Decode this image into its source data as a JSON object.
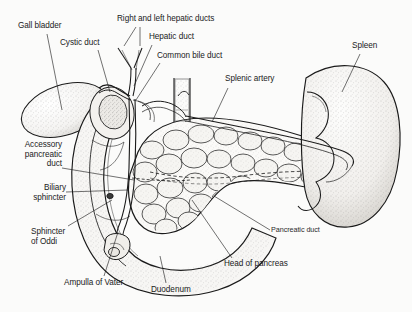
{
  "figure": {
    "style": "black-and-white stippled line drawing",
    "background_color": "#fbfbfa",
    "ink_color": "#1a1a1a"
  },
  "labels": [
    {
      "id": "gall-bladder",
      "text": "Gall bladder",
      "x": 18,
      "y": 21,
      "align": "left"
    },
    {
      "id": "cystic-duct",
      "text": "Cystic duct",
      "x": 60,
      "y": 38,
      "align": "left"
    },
    {
      "id": "hepatic-ducts",
      "text": "Right and left hepatic ducts",
      "x": 117,
      "y": 16,
      "align": "left"
    },
    {
      "id": "hepatic-duct",
      "text": "Hepatic duct",
      "x": 149,
      "y": 33,
      "align": "left"
    },
    {
      "id": "common-bile-duct",
      "text": "Common bile duct",
      "x": 157,
      "y": 52,
      "align": "left"
    },
    {
      "id": "splenic-artery",
      "text": "Splenic artery",
      "x": 225,
      "y": 75,
      "align": "left"
    },
    {
      "id": "spleen",
      "text": "Spleen",
      "x": 352,
      "y": 42,
      "align": "left"
    },
    {
      "id": "accessory-pancreatic-duct",
      "text": "Accessory\npancreatic\nduct",
      "x": 6,
      "y": 140,
      "align": "left"
    },
    {
      "id": "biliary-sphincter",
      "text": "Biliary\nsphincter",
      "x": 24,
      "y": 184,
      "align": "left"
    },
    {
      "id": "sphincter-of-oddi",
      "text": "Sphincter\nof Oddi",
      "x": 33,
      "y": 228,
      "align": "left"
    },
    {
      "id": "ampulla-of-vater",
      "text": "Ampulla of Vater",
      "x": 66,
      "y": 279,
      "align": "left"
    },
    {
      "id": "duodenum",
      "text": "Duodenum",
      "x": 152,
      "y": 285,
      "align": "left"
    },
    {
      "id": "head-of-pancreas",
      "text": "Head of pancreas",
      "x": 225,
      "y": 260,
      "align": "left"
    },
    {
      "id": "pancreatic-duct",
      "text": "Pancreatic duct",
      "x": 272,
      "y": 227,
      "align": "left",
      "small": true
    }
  ],
  "organs": [
    {
      "id": "gall-bladder",
      "name": "Gall bladder",
      "texture": "stippled sac"
    },
    {
      "id": "duodenum",
      "name": "Duodenum",
      "texture": "stippled C-loop"
    },
    {
      "id": "pancreas",
      "name": "Pancreas",
      "texture": "lobular cobblestone"
    },
    {
      "id": "spleen",
      "name": "Spleen",
      "texture": "stippled bean"
    }
  ],
  "ducts": [
    {
      "id": "right-left-hepatic-ducts",
      "name": "Right and left hepatic ducts"
    },
    {
      "id": "hepatic-duct",
      "name": "Hepatic duct"
    },
    {
      "id": "cystic-duct",
      "name": "Cystic duct"
    },
    {
      "id": "common-bile-duct",
      "name": "Common bile duct"
    },
    {
      "id": "pancreatic-duct",
      "name": "Pancreatic duct"
    },
    {
      "id": "accessory-pancreatic-duct",
      "name": "Accessory pancreatic duct"
    }
  ],
  "vessels": [
    {
      "id": "splenic-artery",
      "name": "Splenic artery"
    },
    {
      "id": "aorta-trunk",
      "name": "Vertical vascular trunk"
    }
  ]
}
